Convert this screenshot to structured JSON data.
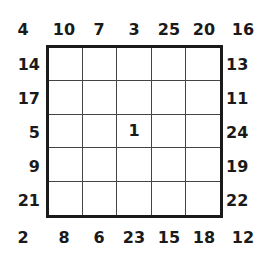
{
  "puzzle": {
    "corners": {
      "top_left": "4",
      "top_right": "16",
      "bottom_left": "2",
      "bottom_right": "12"
    },
    "top_clues": [
      "10",
      "7",
      "3",
      "25",
      "20"
    ],
    "bottom_clues": [
      "8",
      "6",
      "23",
      "15",
      "18"
    ],
    "left_clues": [
      "14",
      "17",
      "5",
      "9",
      "21"
    ],
    "right_clues": [
      "13",
      "11",
      "24",
      "19",
      "22"
    ],
    "grid": [
      [
        "",
        "",
        "",
        "",
        ""
      ],
      [
        "",
        "",
        "",
        "",
        ""
      ],
      [
        "",
        "",
        "1",
        "",
        ""
      ],
      [
        "",
        "",
        "",
        "",
        ""
      ],
      [
        "",
        "",
        "",
        "",
        ""
      ]
    ]
  }
}
